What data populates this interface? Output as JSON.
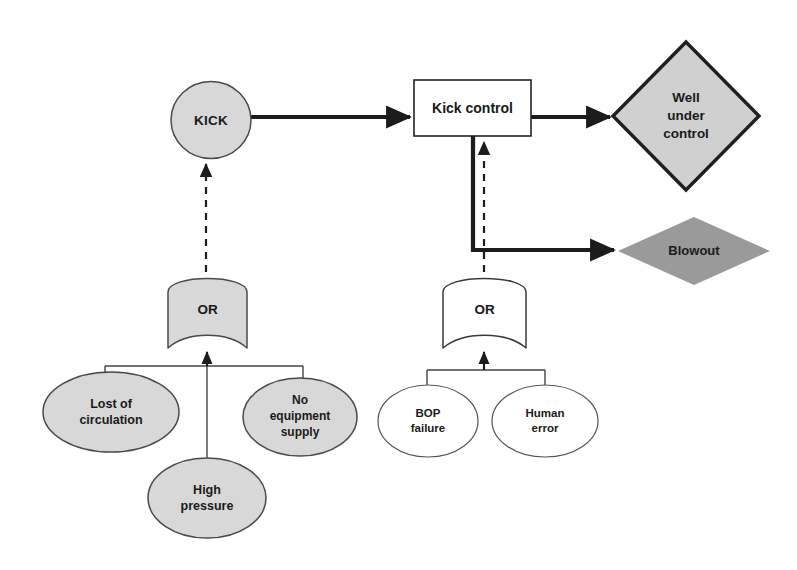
{
  "diagram": {
    "type": "bowtie-fault-tree",
    "canvas": {
      "width": 797,
      "height": 570,
      "background": "#ffffff"
    },
    "palette": {
      "shape_fill_light": "#d8d8d8",
      "shape_fill_dark": "#9a9a9a",
      "shape_fill_white": "#ffffff",
      "stroke_dark": "#3d3d3d",
      "stroke_thin": "#555555",
      "text": "#1a1a1a"
    },
    "nodes": [
      {
        "id": "kick",
        "label": "KICK",
        "shape": "circle",
        "fill": "#d8d8d8",
        "stroke": "#4a4a4a",
        "cx": 211,
        "cy": 120,
        "rx": 40,
        "ry": 38.5
      },
      {
        "id": "kick-control",
        "label": "Kick control",
        "shape": "rectangle",
        "fill": "#ffffff",
        "stroke": "#222222",
        "x": 414,
        "y": 80,
        "width": 117,
        "height": 56
      },
      {
        "id": "well-under-control",
        "label": "Well\nunder\ncontrol",
        "shape": "diamond",
        "fill": "#d0d0d0",
        "stroke": "#1f1f1f",
        "cx": 686,
        "cy": 116,
        "rx": 73,
        "ry": 74
      },
      {
        "id": "blowout",
        "label": "Blowout",
        "shape": "diamond",
        "fill": "#9a9a9a",
        "stroke": "none",
        "cx": 694,
        "cy": 251,
        "rx": 76,
        "ry": 34
      },
      {
        "id": "or-gate-left",
        "label": "OR",
        "shape": "or-gate",
        "fill": "#d8d8d8",
        "stroke": "#4a4a4a",
        "x": 168,
        "y": 272,
        "width": 79,
        "height": 76
      },
      {
        "id": "or-gate-right",
        "label": "OR",
        "shape": "or-gate",
        "fill": "#ffffff",
        "stroke": "#3a3a3a",
        "x": 443,
        "y": 272,
        "width": 83,
        "height": 76
      },
      {
        "id": "lost-of-circulation",
        "label": "Lost of\ncirculation",
        "shape": "ellipse",
        "fill": "#d8d8d8",
        "stroke": "#4a4a4a",
        "cx": 111,
        "cy": 412,
        "rx": 68,
        "ry": 40
      },
      {
        "id": "no-equipment-supply",
        "label": "No\nequipment\nsupply",
        "shape": "ellipse",
        "fill": "#d8d8d8",
        "stroke": "#4a4a4a",
        "cx": 300,
        "cy": 417,
        "rx": 57,
        "ry": 39
      },
      {
        "id": "high-pressure",
        "label": "High\npressure",
        "shape": "ellipse",
        "fill": "#d8d8d8",
        "stroke": "#4a4a4a",
        "cx": 207,
        "cy": 498,
        "rx": 59,
        "ry": 40
      },
      {
        "id": "bop-failure",
        "label": "BOP\nfailure",
        "shape": "ellipse",
        "fill": "#ffffff",
        "stroke": "#555555",
        "cx": 428,
        "cy": 421,
        "rx": 50,
        "ry": 36
      },
      {
        "id": "human-error",
        "label": "Human\nerror",
        "shape": "ellipse",
        "fill": "#ffffff",
        "stroke": "#555555",
        "cx": 545,
        "cy": 421,
        "rx": 53,
        "ry": 36
      }
    ],
    "connectors": [
      {
        "id": "kick-to-kick-control",
        "from": "kick",
        "to": "kick-control",
        "style": "solid-thick",
        "arrow": true
      },
      {
        "id": "kick-control-to-well-under-control",
        "from": "kick-control",
        "to": "well-under-control",
        "style": "solid-thick",
        "arrow": true
      },
      {
        "id": "kick-control-to-blowout",
        "from": "kick-control",
        "to": "blowout",
        "style": "solid-thick",
        "arrow": true
      },
      {
        "id": "or-left-to-kick",
        "from": "or-gate-left",
        "to": "kick",
        "style": "dashed",
        "arrow": true
      },
      {
        "id": "or-right-to-kick-control",
        "from": "or-gate-right",
        "to": "kick-control",
        "style": "dashed",
        "arrow": true
      },
      {
        "id": "left-tree-to-or-left",
        "from": "left-basic-events",
        "to": "or-gate-left",
        "style": "solid-thin",
        "arrow": true
      },
      {
        "id": "right-tree-to-or-right",
        "from": "right-basic-events",
        "to": "or-gate-right",
        "style": "solid-thin",
        "arrow": true
      }
    ]
  }
}
